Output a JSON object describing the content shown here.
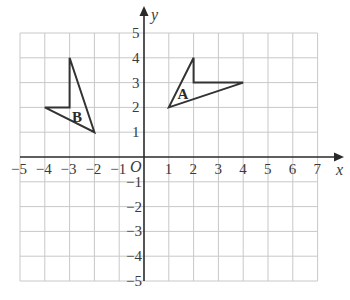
{
  "diagram": {
    "type": "coordinate-grid",
    "x_range": [
      -5,
      7
    ],
    "y_range": [
      -5,
      5
    ],
    "x_axis_label": "x",
    "y_axis_label": "y",
    "origin_label": "O",
    "x_tick_labels": [
      "−5",
      "−4",
      "−3",
      "−2",
      "−1",
      "1",
      "2",
      "3",
      "4",
      "5",
      "6",
      "7"
    ],
    "x_tick_values": [
      -5,
      -4,
      -3,
      -2,
      -1,
      1,
      2,
      3,
      4,
      5,
      6,
      7
    ],
    "y_tick_labels": [
      "5",
      "4",
      "3",
      "2",
      "1",
      "−1",
      "−2",
      "−3",
      "−4",
      "−5"
    ],
    "y_tick_values": [
      5,
      4,
      3,
      2,
      1,
      -1,
      -2,
      -3,
      -4,
      -5
    ],
    "shapes": [
      {
        "label": "A",
        "vertices": [
          [
            1,
            2
          ],
          [
            2,
            4
          ],
          [
            2,
            3
          ],
          [
            4,
            3
          ]
        ],
        "label_position": [
          1.55,
          2.55
        ]
      },
      {
        "label": "B",
        "vertices": [
          [
            -2,
            1
          ],
          [
            -3,
            4
          ],
          [
            -3,
            2
          ],
          [
            -4,
            2
          ]
        ],
        "label_position": [
          -2.7,
          1.6
        ]
      }
    ],
    "colors": {
      "grid": "#c8c8c8",
      "axis": "#2a2a2a",
      "shape": "#333333",
      "text": "#3a3a3a"
    }
  }
}
